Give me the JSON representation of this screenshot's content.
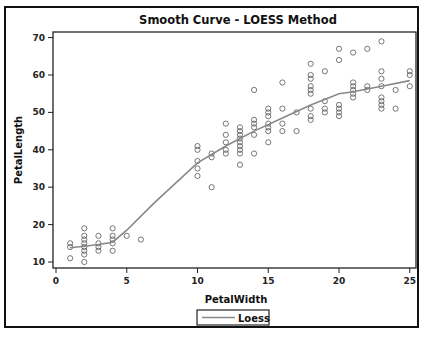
{
  "chart_data": {
    "type": "scatter",
    "title": "Smooth Curve - LOESS Method",
    "xlabel": "PetalWidth",
    "ylabel": "PetalLength",
    "xlim": [
      0,
      25
    ],
    "ylim": [
      10,
      70
    ],
    "xticks": [
      0,
      5,
      10,
      15,
      20,
      25
    ],
    "yticks": [
      10,
      20,
      30,
      40,
      50,
      60,
      70
    ],
    "grid": false,
    "legend": {
      "position": "bottom",
      "entries": [
        "Loess"
      ]
    },
    "series": [
      {
        "name": "observations",
        "type": "scatter",
        "points": [
          [
            1,
            14
          ],
          [
            1,
            15
          ],
          [
            1,
            11
          ],
          [
            2,
            10
          ],
          [
            2,
            12
          ],
          [
            2,
            13
          ],
          [
            2,
            14
          ],
          [
            2,
            15
          ],
          [
            2,
            16
          ],
          [
            2,
            17
          ],
          [
            2,
            19
          ],
          [
            3,
            13
          ],
          [
            3,
            14
          ],
          [
            3,
            15
          ],
          [
            3,
            17
          ],
          [
            4,
            13
          ],
          [
            4,
            15
          ],
          [
            4,
            16
          ],
          [
            4,
            17
          ],
          [
            4,
            19
          ],
          [
            5,
            17
          ],
          [
            6,
            16
          ],
          [
            10,
            33
          ],
          [
            10,
            35
          ],
          [
            10,
            37
          ],
          [
            10,
            40
          ],
          [
            10,
            41
          ],
          [
            11,
            30
          ],
          [
            11,
            38
          ],
          [
            11,
            39
          ],
          [
            12,
            39
          ],
          [
            12,
            40
          ],
          [
            12,
            42
          ],
          [
            12,
            44
          ],
          [
            12,
            47
          ],
          [
            13,
            36
          ],
          [
            13,
            39
          ],
          [
            13,
            40
          ],
          [
            13,
            41
          ],
          [
            13,
            42
          ],
          [
            13,
            43
          ],
          [
            13,
            44
          ],
          [
            13,
            45
          ],
          [
            13,
            46
          ],
          [
            14,
            39
          ],
          [
            14,
            44
          ],
          [
            14,
            46
          ],
          [
            14,
            47
          ],
          [
            14,
            48
          ],
          [
            14,
            56
          ],
          [
            15,
            42
          ],
          [
            15,
            45
          ],
          [
            15,
            46
          ],
          [
            15,
            47
          ],
          [
            15,
            49
          ],
          [
            15,
            50
          ],
          [
            15,
            51
          ],
          [
            16,
            45
          ],
          [
            16,
            47
          ],
          [
            16,
            51
          ],
          [
            16,
            58
          ],
          [
            17,
            45
          ],
          [
            17,
            50
          ],
          [
            18,
            48
          ],
          [
            18,
            49
          ],
          [
            18,
            51
          ],
          [
            18,
            55
          ],
          [
            18,
            56
          ],
          [
            18,
            57
          ],
          [
            18,
            59
          ],
          [
            18,
            60
          ],
          [
            18,
            63
          ],
          [
            19,
            50
          ],
          [
            19,
            51
          ],
          [
            19,
            53
          ],
          [
            19,
            61
          ],
          [
            20,
            49
          ],
          [
            20,
            50
          ],
          [
            20,
            51
          ],
          [
            20,
            52
          ],
          [
            20,
            64
          ],
          [
            20,
            67
          ],
          [
            21,
            54
          ],
          [
            21,
            55
          ],
          [
            21,
            56
          ],
          [
            21,
            57
          ],
          [
            21,
            58
          ],
          [
            21,
            66
          ],
          [
            22,
            56
          ],
          [
            22,
            57
          ],
          [
            22,
            67
          ],
          [
            23,
            51
          ],
          [
            23,
            52
          ],
          [
            23,
            53
          ],
          [
            23,
            54
          ],
          [
            23,
            57
          ],
          [
            23,
            59
          ],
          [
            23,
            61
          ],
          [
            23,
            69
          ],
          [
            24,
            51
          ],
          [
            24,
            56
          ],
          [
            25,
            57
          ],
          [
            25,
            60
          ],
          [
            25,
            61
          ]
        ]
      },
      {
        "name": "Loess",
        "type": "line",
        "x": [
          1,
          2,
          3,
          4,
          5,
          7,
          10,
          12,
          14,
          16,
          18,
          20,
          21,
          23,
          25
        ],
        "y": [
          13.8,
          14.2,
          14.7,
          15.3,
          18.5,
          26,
          36.5,
          41,
          45,
          48.5,
          52,
          55,
          55.5,
          57,
          58.5
        ]
      }
    ]
  }
}
